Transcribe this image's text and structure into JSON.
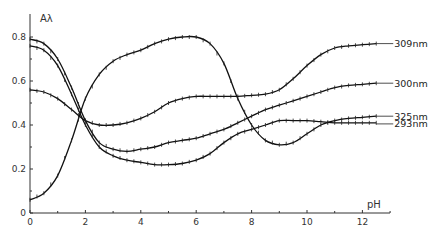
{
  "chart_data": {
    "type": "line",
    "title": "",
    "xlabel": "pH",
    "ylabel": "Aλ",
    "xlim": [
      0,
      13
    ],
    "ylim": [
      0,
      0.88
    ],
    "x_ticks": [
      0,
      2,
      4,
      6,
      8,
      10,
      12
    ],
    "x_minor_ticks": [
      1,
      3,
      5,
      7,
      9,
      11,
      13
    ],
    "y_ticks": [
      0,
      0.2,
      0.4,
      0.6,
      0.8
    ],
    "y_tick_labels": [
      "0",
      "0.2",
      "0.4",
      "0.6",
      "0.8"
    ],
    "x_tick_labels": [
      "0",
      "2",
      "4",
      "6",
      "8",
      "10",
      "12"
    ],
    "grid": false,
    "legend": "inline labels at right end of each curve",
    "series": [
      {
        "name": "309nm",
        "x": [
          0,
          0.5,
          1,
          1.5,
          2,
          2.5,
          3,
          3.5,
          4,
          4.5,
          5,
          5.5,
          6,
          6.5,
          7,
          7.5,
          8,
          8.5,
          9,
          9.5,
          10,
          10.5,
          11,
          11.5,
          12,
          12.5
        ],
        "values": [
          0.56,
          0.55,
          0.52,
          0.47,
          0.42,
          0.4,
          0.4,
          0.41,
          0.43,
          0.46,
          0.5,
          0.52,
          0.53,
          0.53,
          0.53,
          0.53,
          0.535,
          0.54,
          0.56,
          0.61,
          0.67,
          0.72,
          0.75,
          0.76,
          0.765,
          0.77
        ]
      },
      {
        "name": "300nm",
        "x": [
          0,
          0.5,
          1,
          1.5,
          2,
          2.5,
          3,
          3.5,
          4,
          4.5,
          5,
          5.5,
          6,
          6.5,
          7,
          7.5,
          8,
          8.5,
          9,
          9.5,
          10,
          10.5,
          11,
          11.5,
          12,
          12.5
        ],
        "values": [
          0.79,
          0.77,
          0.7,
          0.57,
          0.42,
          0.32,
          0.29,
          0.28,
          0.29,
          0.3,
          0.32,
          0.33,
          0.34,
          0.36,
          0.38,
          0.41,
          0.44,
          0.47,
          0.49,
          0.51,
          0.53,
          0.55,
          0.57,
          0.58,
          0.585,
          0.59
        ]
      },
      {
        "name": "325nm",
        "x": [
          0,
          0.5,
          1,
          1.5,
          2,
          2.5,
          3,
          3.5,
          4,
          4.5,
          5,
          5.5,
          6,
          6.5,
          7,
          7.5,
          8,
          8.5,
          9,
          9.5,
          10,
          10.5,
          11,
          11.5,
          12,
          12.5
        ],
        "values": [
          0.06,
          0.09,
          0.17,
          0.33,
          0.52,
          0.63,
          0.69,
          0.72,
          0.74,
          0.77,
          0.79,
          0.8,
          0.8,
          0.77,
          0.68,
          0.52,
          0.4,
          0.33,
          0.31,
          0.32,
          0.36,
          0.4,
          0.42,
          0.43,
          0.435,
          0.44
        ]
      },
      {
        "name": "293nm",
        "x": [
          0,
          0.5,
          1,
          1.5,
          2,
          2.5,
          3,
          3.5,
          4,
          4.5,
          5,
          5.5,
          6,
          6.5,
          7,
          7.5,
          8,
          8.5,
          9,
          9.5,
          10,
          10.5,
          11,
          11.5,
          12,
          12.5
        ],
        "values": [
          0.76,
          0.74,
          0.67,
          0.54,
          0.4,
          0.3,
          0.26,
          0.24,
          0.23,
          0.22,
          0.22,
          0.225,
          0.24,
          0.27,
          0.32,
          0.36,
          0.38,
          0.4,
          0.42,
          0.42,
          0.42,
          0.415,
          0.41,
          0.41,
          0.41,
          0.41
        ]
      }
    ]
  },
  "labels": {
    "y_axis_title": "Aλ",
    "x_axis_title": "pH"
  }
}
